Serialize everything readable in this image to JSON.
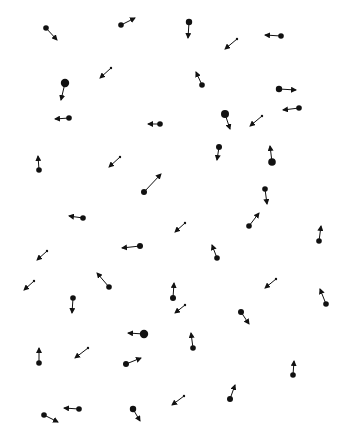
{
  "diagram": {
    "type": "particle-velocity-field",
    "width": 349,
    "height": 437,
    "background": "#ffffff",
    "ink": "#111111",
    "particles": [
      {
        "x": 46,
        "y": 28,
        "r": 2.8,
        "tx": 57,
        "ty": 40
      },
      {
        "x": 121,
        "y": 25,
        "r": 2.8,
        "tx": 135,
        "ty": 18
      },
      {
        "x": 189,
        "y": 22,
        "r": 3.2,
        "tx": 188,
        "ty": 38
      },
      {
        "x": 237,
        "y": 39,
        "r": 1.2,
        "tx": 225,
        "ty": 49
      },
      {
        "x": 281,
        "y": 36,
        "r": 2.8,
        "tx": 265,
        "ty": 35
      },
      {
        "x": 65,
        "y": 83,
        "r": 4.2,
        "tx": 61,
        "ty": 100
      },
      {
        "x": 111,
        "y": 68,
        "r": 1.2,
        "tx": 100,
        "ty": 78
      },
      {
        "x": 202,
        "y": 85,
        "r": 2.8,
        "tx": 196,
        "ty": 72
      },
      {
        "x": 279,
        "y": 89,
        "r": 3.2,
        "tx": 296,
        "ty": 90
      },
      {
        "x": 299,
        "y": 108,
        "r": 2.8,
        "tx": 283,
        "ty": 110
      },
      {
        "x": 69,
        "y": 118,
        "r": 2.8,
        "tx": 55,
        "ty": 119
      },
      {
        "x": 160,
        "y": 124,
        "r": 2.8,
        "tx": 148,
        "ty": 124
      },
      {
        "x": 225,
        "y": 114,
        "r": 4.0,
        "tx": 230,
        "ty": 129
      },
      {
        "x": 262,
        "y": 116,
        "r": 1.2,
        "tx": 250,
        "ty": 126
      },
      {
        "x": 39,
        "y": 170,
        "r": 2.8,
        "tx": 38,
        "ty": 156
      },
      {
        "x": 120,
        "y": 157,
        "r": 1.2,
        "tx": 109,
        "ty": 167
      },
      {
        "x": 219,
        "y": 147,
        "r": 3.0,
        "tx": 217,
        "ty": 160
      },
      {
        "x": 272,
        "y": 162,
        "r": 3.8,
        "tx": 270,
        "ty": 146
      },
      {
        "x": 144,
        "y": 192,
        "r": 3.0,
        "tx": 161,
        "ty": 174
      },
      {
        "x": 265,
        "y": 189,
        "r": 2.8,
        "tx": 267,
        "ty": 204
      },
      {
        "x": 83,
        "y": 218,
        "r": 2.8,
        "tx": 69,
        "ty": 216
      },
      {
        "x": 185,
        "y": 223,
        "r": 1.2,
        "tx": 175,
        "ty": 232
      },
      {
        "x": 249,
        "y": 226,
        "r": 2.8,
        "tx": 259,
        "ty": 213
      },
      {
        "x": 319,
        "y": 241,
        "r": 2.8,
        "tx": 321,
        "ty": 226
      },
      {
        "x": 47,
        "y": 251,
        "r": 1.2,
        "tx": 37,
        "ty": 260
      },
      {
        "x": 140,
        "y": 246,
        "r": 3.0,
        "tx": 122,
        "ty": 248
      },
      {
        "x": 217,
        "y": 258,
        "r": 2.8,
        "tx": 212,
        "ty": 245
      },
      {
        "x": 34,
        "y": 281,
        "r": 1.2,
        "tx": 24,
        "ty": 290
      },
      {
        "x": 109,
        "y": 287,
        "r": 2.8,
        "tx": 97,
        "ty": 273
      },
      {
        "x": 276,
        "y": 279,
        "r": 1.2,
        "tx": 265,
        "ty": 288
      },
      {
        "x": 173,
        "y": 298,
        "r": 3.0,
        "tx": 174,
        "ty": 283
      },
      {
        "x": 185,
        "y": 305,
        "r": 1.2,
        "tx": 175,
        "ty": 313
      },
      {
        "x": 73,
        "y": 298,
        "r": 2.8,
        "tx": 72,
        "ty": 313
      },
      {
        "x": 326,
        "y": 304,
        "r": 2.8,
        "tx": 320,
        "ty": 289
      },
      {
        "x": 241,
        "y": 312,
        "r": 3.0,
        "tx": 249,
        "ty": 324
      },
      {
        "x": 144,
        "y": 334,
        "r": 4.2,
        "tx": 128,
        "ty": 333
      },
      {
        "x": 193,
        "y": 348,
        "r": 2.8,
        "tx": 191,
        "ty": 333
      },
      {
        "x": 39,
        "y": 363,
        "r": 2.8,
        "tx": 39,
        "ty": 348
      },
      {
        "x": 88,
        "y": 348,
        "r": 1.2,
        "tx": 75,
        "ty": 358
      },
      {
        "x": 126,
        "y": 364,
        "r": 3.0,
        "tx": 141,
        "ty": 358
      },
      {
        "x": 293,
        "y": 375,
        "r": 2.8,
        "tx": 294,
        "ty": 361
      },
      {
        "x": 184,
        "y": 396,
        "r": 1.2,
        "tx": 172,
        "ty": 405
      },
      {
        "x": 230,
        "y": 399,
        "r": 3.0,
        "tx": 235,
        "ty": 385
      },
      {
        "x": 79,
        "y": 409,
        "r": 2.8,
        "tx": 64,
        "ty": 408
      },
      {
        "x": 133,
        "y": 409,
        "r": 3.2,
        "tx": 140,
        "ty": 421
      },
      {
        "x": 44,
        "y": 415,
        "r": 2.8,
        "tx": 58,
        "ty": 422
      }
    ]
  }
}
